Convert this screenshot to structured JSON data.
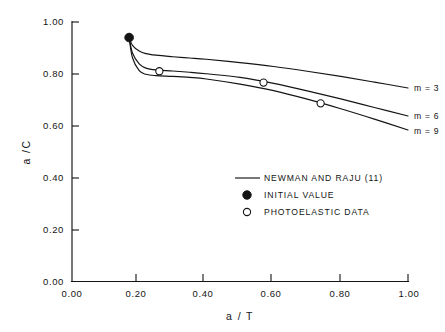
{
  "chart_data": {
    "type": "line",
    "title": "",
    "xlabel": "a / T",
    "ylabel": "a /C",
    "xlim": [
      0.0,
      1.0
    ],
    "ylim": [
      0.0,
      1.0
    ],
    "grid": false,
    "xticks": [
      "0.00",
      "0.20",
      "0.40",
      "0.60",
      "0.80",
      "1.00"
    ],
    "xtick_values": [
      0.0,
      0.2,
      0.4,
      0.6,
      0.8,
      1.0
    ],
    "yticks": [
      "0.00",
      "0.20",
      "0.40",
      "0.60",
      "0.80",
      "1.00"
    ],
    "ytick_values": [
      0.0,
      0.2,
      0.4,
      0.6,
      0.8,
      1.0
    ],
    "legend_position": "center-right-inside",
    "series": [
      {
        "name": "m = 3",
        "label": "m = 3",
        "x": [
          0.17,
          0.18,
          0.2,
          0.22,
          0.25,
          0.3,
          0.35,
          0.4,
          0.5,
          0.6,
          0.7,
          0.8,
          0.9,
          1.0
        ],
        "values": [
          0.94,
          0.91,
          0.888,
          0.878,
          0.872,
          0.866,
          0.861,
          0.856,
          0.843,
          0.828,
          0.81,
          0.79,
          0.768,
          0.745
        ]
      },
      {
        "name": "m = 6",
        "label": "m = 6",
        "x": [
          0.17,
          0.18,
          0.2,
          0.22,
          0.25,
          0.3,
          0.35,
          0.4,
          0.5,
          0.6,
          0.7,
          0.8,
          0.9,
          1.0
        ],
        "values": [
          0.94,
          0.88,
          0.838,
          0.822,
          0.815,
          0.811,
          0.806,
          0.8,
          0.786,
          0.763,
          0.734,
          0.703,
          0.67,
          0.637
        ]
      },
      {
        "name": "m = 9",
        "label": "m = 9",
        "x": [
          0.17,
          0.18,
          0.2,
          0.22,
          0.25,
          0.3,
          0.35,
          0.4,
          0.5,
          0.6,
          0.7,
          0.8,
          0.9,
          1.0
        ],
        "values": [
          0.94,
          0.862,
          0.812,
          0.798,
          0.793,
          0.79,
          0.786,
          0.78,
          0.76,
          0.735,
          0.702,
          0.665,
          0.625,
          0.583
        ]
      }
    ],
    "initial_value_point": {
      "x": 0.17,
      "y": 0.94
    },
    "photoelastic_points": [
      {
        "x": 0.26,
        "y": 0.81
      },
      {
        "x": 0.57,
        "y": 0.766
      },
      {
        "x": 0.74,
        "y": 0.686
      }
    ]
  },
  "legend": {
    "items": [
      {
        "marker": "line",
        "label": "NEWMAN  AND  RAJU  (11)"
      },
      {
        "marker": "filled-circle",
        "label": "INITIAL VALUE"
      },
      {
        "marker": "open-circle",
        "label": "PHOTOELASTIC DATA"
      }
    ]
  }
}
